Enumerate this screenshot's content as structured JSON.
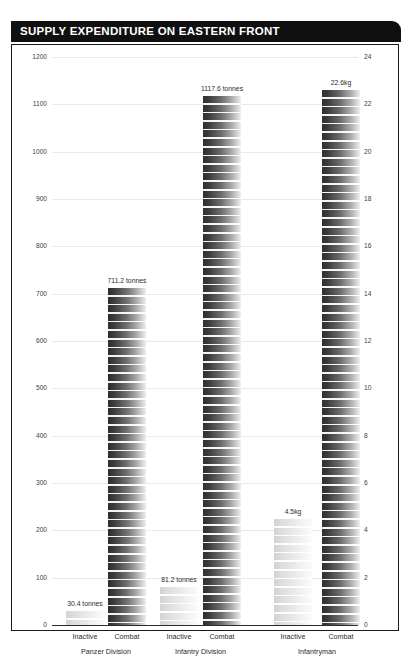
{
  "title": "SUPPLY EXPENDITURE ON EASTERN FRONT",
  "chart_data": {
    "type": "bar",
    "title": "SUPPLY EXPENDITURE ON EASTERN FRONT",
    "xlabel": "",
    "ylabel": "",
    "grid": true,
    "legend": "none",
    "left_axis": {
      "unit": "tonnes",
      "ylim": [
        0,
        1200
      ],
      "ticks": [
        0,
        100,
        200,
        300,
        400,
        500,
        600,
        700,
        800,
        900,
        1000,
        1100,
        1200
      ]
    },
    "right_axis": {
      "unit": "kg",
      "ylim": [
        0,
        24
      ],
      "ticks": [
        0,
        2,
        4,
        6,
        8,
        10,
        12,
        14,
        16,
        18,
        20,
        22,
        24
      ]
    },
    "groups": [
      {
        "name": "Panzer Division",
        "axis": "left",
        "bars": [
          {
            "category": "Inactive",
            "value": 30.4,
            "label": "30.4 tonnes",
            "shade": "light"
          },
          {
            "category": "Combat",
            "value": 711.2,
            "label": "711.2 tonnes",
            "shade": "dark"
          }
        ]
      },
      {
        "name": "Infantry Division",
        "axis": "left",
        "bars": [
          {
            "category": "Inactive",
            "value": 81.2,
            "label": "81.2 tonnes",
            "shade": "light"
          },
          {
            "category": "Combat",
            "value": 1117.6,
            "label": "1117.6 tonnes",
            "shade": "dark"
          }
        ]
      },
      {
        "name": "Infantryman",
        "axis": "right",
        "bars": [
          {
            "category": "Inactive",
            "value": 4.5,
            "label": "4.5kg",
            "shade": "light"
          },
          {
            "category": "Combat",
            "value": 22.6,
            "label": "22.6kg",
            "shade": "dark"
          }
        ]
      }
    ]
  }
}
